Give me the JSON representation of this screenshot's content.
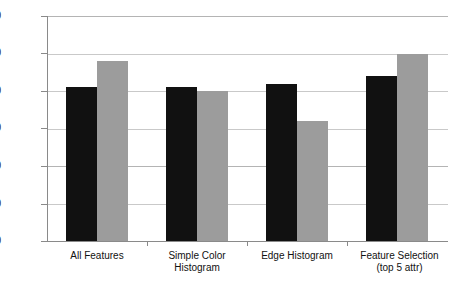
{
  "chart_data": {
    "type": "bar",
    "title": "",
    "xlabel": "",
    "ylabel": "",
    "ylim": [
      0,
      60
    ],
    "ytick_step": 10,
    "yticks": [
      "0",
      "10",
      "20",
      "30",
      "40",
      "50",
      "60"
    ],
    "grid": true,
    "legend": "none",
    "categories": [
      "All Features",
      "Simple Color\nHistogram",
      "Edge Histogram",
      "Feature Selection\n(top 5 attr)"
    ],
    "series": [
      {
        "name": "series-1",
        "color": "#111111",
        "values": [
          41,
          41,
          42,
          44
        ]
      },
      {
        "name": "series-2",
        "color": "#9c9c9c",
        "values": [
          48,
          40,
          32,
          50
        ]
      }
    ]
  }
}
